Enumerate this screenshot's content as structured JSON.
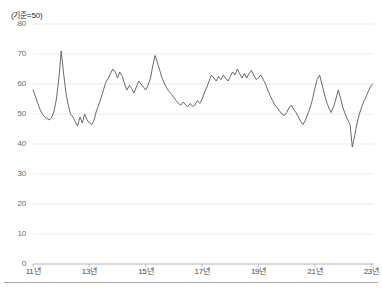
{
  "figure": {
    "unit_note": "(기준=50)",
    "background_color": "#ffffff",
    "line_color": "#595959",
    "grid_color": "#e3e3e3",
    "axis_color": "#b0b0b0"
  },
  "axes": {
    "y_ticks": [
      "80",
      "70",
      "60",
      "50",
      "40",
      "30",
      "20",
      "10",
      "0"
    ],
    "x_ticks": [
      "11년",
      "13년",
      "15년",
      "17년",
      "19년",
      "21년",
      "23년"
    ]
  },
  "chart_data": {
    "type": "line",
    "title": "",
    "subtitle": "",
    "xlabel": "",
    "ylabel": "(기준=50)",
    "legend": [],
    "legend_position": "none",
    "grid": true,
    "xlim": [
      2011.0,
      2023.1
    ],
    "ylim": [
      0,
      80
    ],
    "yticks": [
      0,
      10,
      20,
      30,
      40,
      50,
      60,
      70,
      80
    ],
    "xticks": [
      2011,
      2013,
      2015,
      2017,
      2019,
      2021,
      2023
    ],
    "xticklabels": [
      "11년",
      "13년",
      "15년",
      "17년",
      "19년",
      "21년",
      "23년"
    ],
    "reference_line": 50,
    "series": [
      {
        "name": "지수",
        "color": "#595959",
        "x": [
          2011.0,
          2011.08,
          2011.17,
          2011.25,
          2011.33,
          2011.42,
          2011.5,
          2011.58,
          2011.67,
          2011.75,
          2011.83,
          2011.92,
          2012.0,
          2012.08,
          2012.17,
          2012.25,
          2012.33,
          2012.42,
          2012.5,
          2012.58,
          2012.67,
          2012.75,
          2012.83,
          2012.92,
          2013.0,
          2013.08,
          2013.17,
          2013.25,
          2013.33,
          2013.42,
          2013.5,
          2013.58,
          2013.67,
          2013.75,
          2013.83,
          2013.92,
          2014.0,
          2014.08,
          2014.17,
          2014.25,
          2014.33,
          2014.42,
          2014.5,
          2014.58,
          2014.67,
          2014.75,
          2014.83,
          2014.92,
          2015.0,
          2015.08,
          2015.17,
          2015.25,
          2015.33,
          2015.42,
          2015.5,
          2015.58,
          2015.67,
          2015.75,
          2015.83,
          2015.92,
          2016.0,
          2016.08,
          2016.17,
          2016.25,
          2016.33,
          2016.42,
          2016.5,
          2016.58,
          2016.67,
          2016.75,
          2016.83,
          2016.92,
          2017.0,
          2017.08,
          2017.17,
          2017.25,
          2017.33,
          2017.42,
          2017.5,
          2017.58,
          2017.67,
          2017.75,
          2017.83,
          2017.92,
          2018.0,
          2018.08,
          2018.17,
          2018.25,
          2018.33,
          2018.42,
          2018.5,
          2018.58,
          2018.67,
          2018.75,
          2018.83,
          2018.92,
          2019.0,
          2019.08,
          2019.17,
          2019.25,
          2019.33,
          2019.42,
          2019.5,
          2019.58,
          2019.67,
          2019.75,
          2019.83,
          2019.92,
          2020.0,
          2020.08,
          2020.17,
          2020.25,
          2020.33,
          2020.42,
          2020.5,
          2020.58,
          2020.67,
          2020.75,
          2020.83,
          2020.92,
          2021.0,
          2021.08,
          2021.17,
          2021.25,
          2021.33,
          2021.42,
          2021.5,
          2021.58,
          2021.67,
          2021.75,
          2021.83,
          2021.92,
          2022.0,
          2022.08,
          2022.17,
          2022.25,
          2022.33,
          2022.42,
          2022.5,
          2022.58,
          2022.67,
          2022.75,
          2022.83,
          2022.92,
          2023.0,
          2023.05
        ],
        "y": [
          58.0,
          56.0,
          53.5,
          51.5,
          50.0,
          49.0,
          48.5,
          48.0,
          49.0,
          51.0,
          55.0,
          62.0,
          71.0,
          64.0,
          57.0,
          53.0,
          50.0,
          49.0,
          47.5,
          46.0,
          49.0,
          47.0,
          50.0,
          48.0,
          47.0,
          46.5,
          48.0,
          51.0,
          53.0,
          55.5,
          58.0,
          60.5,
          62.0,
          63.5,
          65.0,
          64.0,
          62.0,
          64.0,
          62.5,
          60.0,
          58.0,
          59.5,
          58.5,
          57.0,
          59.0,
          61.0,
          60.0,
          59.0,
          58.0,
          59.5,
          62.0,
          66.0,
          69.5,
          67.0,
          64.5,
          62.0,
          60.0,
          58.5,
          57.5,
          56.5,
          55.5,
          54.5,
          53.5,
          53.0,
          54.0,
          53.0,
          52.5,
          53.5,
          52.5,
          53.0,
          54.5,
          53.5,
          55.0,
          57.0,
          59.0,
          61.0,
          63.0,
          62.0,
          61.0,
          62.5,
          61.5,
          63.0,
          62.0,
          61.0,
          62.5,
          64.0,
          63.0,
          65.0,
          63.5,
          62.0,
          63.5,
          62.0,
          63.5,
          64.5,
          63.0,
          61.5,
          62.0,
          63.0,
          61.5,
          60.0,
          58.0,
          56.0,
          54.5,
          53.0,
          52.0,
          51.0,
          50.0,
          49.5,
          50.5,
          52.0,
          53.0,
          51.5,
          50.5,
          49.0,
          47.5,
          46.5,
          48.0,
          50.0,
          52.0,
          55.0,
          58.5,
          61.5,
          63.0,
          60.0,
          57.0,
          54.0,
          52.0,
          50.5,
          52.5,
          55.0,
          58.0,
          55.0,
          52.0,
          50.0,
          48.0,
          46.5,
          39.0,
          43.0,
          47.0,
          50.0,
          52.5,
          54.5,
          56.0,
          58.0,
          59.5,
          60.0
        ]
      }
    ]
  }
}
